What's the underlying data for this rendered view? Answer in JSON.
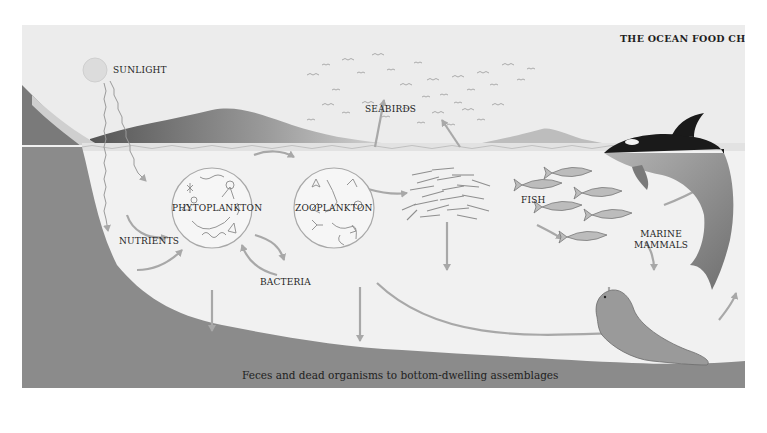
{
  "title": "THE OCEAN FOOD CHAIN",
  "labels": {
    "sunlight": "SUNLIGHT",
    "seabirds": "SEABIRDS",
    "phytoplankton": "PHYTOPLANKTON",
    "zooplankton": "ZOOPLANKTON",
    "nutrients": "NUTRIENTS",
    "bacteria": "BACTERIA",
    "fish": "FISH",
    "marine_mammals_line1": "MARINE",
    "marine_mammals_line2": "MAMMALS"
  },
  "caption": "Feces and dead organisms to bottom-dwelling assemblages",
  "elements": [
    {
      "name": "sun",
      "icon": "sun-icon"
    },
    {
      "name": "seabirds",
      "icon": "bird-flock-icon"
    },
    {
      "name": "phytoplankton",
      "icon": "phytoplankton-circle-icon"
    },
    {
      "name": "zooplankton",
      "icon": "zooplankton-circle-icon"
    },
    {
      "name": "small-fish-school",
      "icon": "fish-school-icon"
    },
    {
      "name": "fish",
      "icon": "tuna-icon"
    },
    {
      "name": "orca",
      "icon": "orca-icon"
    },
    {
      "name": "seal",
      "icon": "seal-icon"
    }
  ],
  "flows": [
    {
      "from": "sunlight",
      "to": "phytoplankton"
    },
    {
      "from": "nutrients",
      "to": "phytoplankton"
    },
    {
      "from": "phytoplankton",
      "to": "zooplankton"
    },
    {
      "from": "phytoplankton",
      "to": "bacteria"
    },
    {
      "from": "bacteria",
      "to": "phytoplankton"
    },
    {
      "from": "zooplankton",
      "to": "small-fish-school"
    },
    {
      "from": "zooplankton",
      "to": "seabirds"
    },
    {
      "from": "small-fish-school",
      "to": "seabirds"
    },
    {
      "from": "zooplankton",
      "to": "marine-mammals"
    },
    {
      "from": "fish",
      "to": "marine-mammals"
    },
    {
      "from": "seal",
      "to": "orca"
    },
    {
      "from": "all",
      "to": "bottom-dwelling assemblages"
    }
  ],
  "colors": {
    "sky": "#ececec",
    "water": "#f0f0f0",
    "seafloor": "#8a8a8a",
    "arrow": "#a8a8a8",
    "orca": "#1a1a1a",
    "text": "#1e1e1e"
  }
}
